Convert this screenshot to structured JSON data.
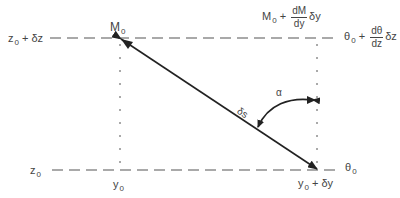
{
  "diagram": {
    "labels": {
      "z_top": {
        "base": "z",
        "sub": "0",
        "rest": " + δz"
      },
      "z_bottom": {
        "base": "z",
        "sub": "0"
      },
      "m0": {
        "base": "M",
        "sub": "0"
      },
      "m_top_right": {
        "base": "M",
        "sub": "0",
        "plus": " + ",
        "num": "dM",
        "den": "dy",
        "tail": "δy"
      },
      "theta_top_right": {
        "base": "θ",
        "sub": "0",
        "plus": " + ",
        "num": "dθ",
        "den": "dz",
        "tail": "δz"
      },
      "theta_bottom_right": {
        "base": "θ",
        "sub": "0"
      },
      "y0": {
        "base": "y",
        "sub": "0"
      },
      "y0_dy": {
        "base": "y",
        "sub": "0",
        "rest": " + δy"
      },
      "ds": "δs",
      "alpha": "α"
    },
    "colors": {
      "line": "#222222",
      "dash": "#555555",
      "text": "#444444"
    }
  }
}
